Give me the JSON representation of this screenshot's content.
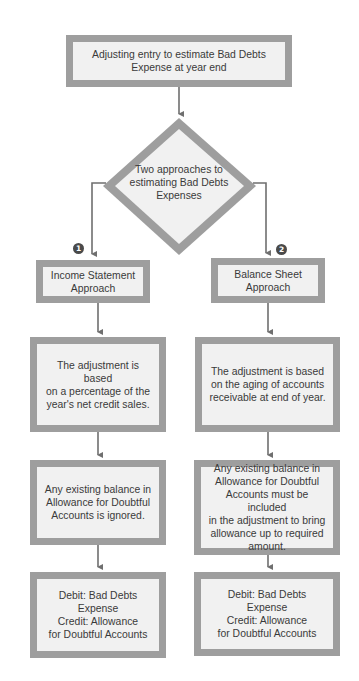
{
  "diagram": {
    "type": "flowchart",
    "colors": {
      "box_border": "#9e9e9e",
      "box_fill": "#f1f1f1",
      "arrow": "#6f6f6f",
      "text": "#3a3a3a",
      "badge": "#4a4a4a"
    },
    "start": {
      "label": "Adjusting entry to estimate Bad Debts\nExpense at year end"
    },
    "decision": {
      "label": "Two approaches to\nestimating Bad Debts\nExpenses"
    },
    "branches": [
      {
        "badge": "1",
        "title": "Income Statement\nApproach",
        "basis": "The adjustment is based\non a percentage of the\nyear's net credit sales.",
        "existing_balance": "Any existing balance in\nAllowance for Doubtful\nAccounts is ignored.",
        "entry": "Debit: Bad Debts Expense\nCredit: Allowance\nfor Doubtful Accounts"
      },
      {
        "badge": "2",
        "title": "Balance Sheet\nApproach",
        "basis": "The adjustment is based\non the aging of accounts\nreceivable at end of year.",
        "existing_balance": "Any existing balance in\nAllowance for Doubtful\nAccounts must be included\nin the adjustment to bring\nallowance up to required\namount.",
        "entry": "Debit: Bad Debts Expense\nCredit: Allowance\nfor Doubtful Accounts"
      }
    ]
  }
}
